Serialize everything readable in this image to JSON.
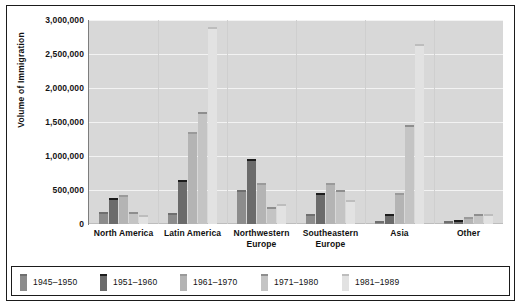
{
  "chart_data": {
    "type": "bar",
    "title": "",
    "xlabel": "",
    "ylabel": "Volume of Immigration",
    "ylim": [
      0,
      3000000
    ],
    "ytick_labels": [
      "3,000,000",
      "2,500,000",
      "2,000,000",
      "1,500,000",
      "1,000,000",
      "500,000",
      "0"
    ],
    "ytick_values": [
      3000000,
      2500000,
      2000000,
      1500000,
      1000000,
      500000,
      0
    ],
    "grid": true,
    "legend_position": "bottom",
    "categories": [
      "North America",
      "Latin America",
      "Northwestern Europe",
      "Southeastern Europe",
      "Asia",
      "Other"
    ],
    "category_lines": [
      [
        "North America"
      ],
      [
        "Latin America"
      ],
      [
        "Northwestern",
        "Europe"
      ],
      [
        "Southeastern",
        "Europe"
      ],
      [
        "Asia"
      ],
      [
        "Other"
      ]
    ],
    "series": [
      {
        "name": "1945–1950",
        "color": "#8c8c8c",
        "top_color": "#6f6f6f",
        "values": [
          180000,
          160000,
          500000,
          150000,
          35000,
          30000
        ]
      },
      {
        "name": "1951–1960",
        "color": "#6b6b6b",
        "top_color": "#1c1c1c",
        "values": [
          380000,
          650000,
          950000,
          450000,
          150000,
          60000
        ]
      },
      {
        "name": "1961–1970",
        "color": "#b4b4b4",
        "top_color": "#9a9a9a",
        "values": [
          430000,
          1350000,
          600000,
          600000,
          450000,
          100000
        ]
      },
      {
        "name": "1971–1980",
        "color": "#c4c4c4",
        "top_color": "#8e8e8e",
        "values": [
          170000,
          1650000,
          250000,
          500000,
          1450000,
          150000
        ]
      },
      {
        "name": "1981–1989",
        "color": "#e2e2e2",
        "top_color": "#bdbdbd",
        "values": [
          130000,
          2900000,
          300000,
          350000,
          2650000,
          140000
        ]
      }
    ]
  },
  "legend": {
    "items": [
      {
        "label": "1945–1950"
      },
      {
        "label": "1951–1960"
      },
      {
        "label": "1961–1970"
      },
      {
        "label": "1971–1980"
      },
      {
        "label": "1981–1989"
      }
    ]
  },
  "colors": {
    "plot_background": "#d8d8d8",
    "grid": "#f3f3f3",
    "frame": "#1b1b1b",
    "text": "#111111"
  }
}
